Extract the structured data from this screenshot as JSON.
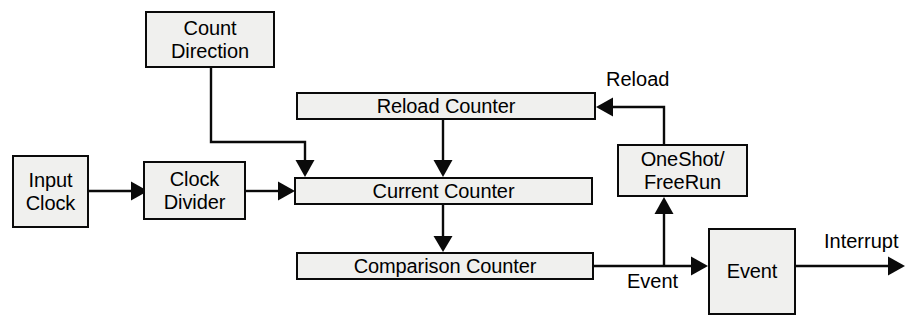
{
  "diagram": {
    "type": "block-diagram",
    "canvas": {
      "width": 912,
      "height": 331
    },
    "style": {
      "background": "#ffffff",
      "box_fill": "#f0f0ee",
      "stroke": "#0a0a0a",
      "text_color": "#000000"
    },
    "blocks": [
      {
        "id": "count-direction",
        "label": "Count\nDirection",
        "x": 145,
        "y": 11,
        "w": 130,
        "h": 57
      },
      {
        "id": "reload-counter",
        "label": "Reload Counter",
        "x": 296,
        "y": 92,
        "w": 300,
        "h": 28
      },
      {
        "id": "input-clock",
        "label": "Input\nClock",
        "x": 12,
        "y": 155,
        "w": 77,
        "h": 73
      },
      {
        "id": "clock-divider",
        "label": "Clock\nDivider",
        "x": 143,
        "y": 161,
        "w": 103,
        "h": 59
      },
      {
        "id": "current-counter",
        "label": "Current Counter",
        "x": 294,
        "y": 177,
        "w": 299,
        "h": 28
      },
      {
        "id": "oneshot-freerun",
        "label": "OneShot/\nFreeRun",
        "x": 617,
        "y": 144,
        "w": 131,
        "h": 53
      },
      {
        "id": "comparison-counter",
        "label": "Comparison Counter",
        "x": 296,
        "y": 252,
        "w": 298,
        "h": 28
      },
      {
        "id": "event",
        "label": "Event",
        "x": 708,
        "y": 228,
        "w": 88,
        "h": 87
      }
    ],
    "edge_labels": [
      {
        "id": "reload-label",
        "text": "Reload",
        "x": 606,
        "y": 69
      },
      {
        "id": "event-label",
        "text": "Event",
        "x": 627,
        "y": 271
      },
      {
        "id": "interrupt-label",
        "text": "Interrupt",
        "x": 824,
        "y": 231
      }
    ],
    "connections": [
      {
        "id": "input-clock-to-clock-divider",
        "from": "input-clock",
        "to": "clock-divider",
        "label": ""
      },
      {
        "id": "clock-divider-to-current-counter",
        "from": "clock-divider",
        "to": "current-counter",
        "label": ""
      },
      {
        "id": "count-direction-to-current-counter",
        "from": "count-direction",
        "to": "current-counter",
        "label": ""
      },
      {
        "id": "reload-counter-to-current-counter",
        "from": "reload-counter",
        "to": "current-counter",
        "label": ""
      },
      {
        "id": "current-counter-to-comparison",
        "from": "current-counter",
        "to": "comparison-counter",
        "label": ""
      },
      {
        "id": "oneshot-to-reload-counter",
        "from": "oneshot-freerun",
        "to": "reload-counter",
        "label": "Reload"
      },
      {
        "id": "comparison-to-event",
        "from": "comparison-counter",
        "to": "event",
        "label": "Event"
      },
      {
        "id": "event-tap-to-oneshot",
        "from": "comparison-counter",
        "to": "oneshot-freerun",
        "label": ""
      },
      {
        "id": "event-to-interrupt-out",
        "from": "event",
        "to": "interrupt-output",
        "label": "Interrupt"
      }
    ]
  }
}
